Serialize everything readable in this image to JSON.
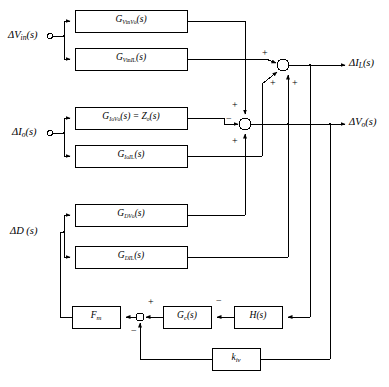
{
  "diagram": {
    "inputs": [
      {
        "id": "dvin",
        "label_html": "ΔV<sub class=\"sub\">in</sub>(s)",
        "terminal": "open-circle"
      },
      {
        "id": "dio",
        "label_html": "ΔI<sub class=\"sub\">o</sub>(s)",
        "terminal": "open-circle"
      },
      {
        "id": "dd",
        "label_html": "ΔD (s)",
        "terminal": "none"
      }
    ],
    "outputs": [
      {
        "id": "dil",
        "label_html": "ΔI<sub class=\"sub\">L</sub>(s)"
      },
      {
        "id": "dvo",
        "label_html": "ΔV<sub class=\"sub\">o</sub>(s)"
      }
    ],
    "blocks": [
      {
        "id": "g_vin_vo",
        "label_html": "G<sub class=\"sub2\">V<span class=\"up\">in</span>V<span class=\"up\">o</span></sub>(s)",
        "x": 75,
        "y": 10,
        "w": 112,
        "h": 22
      },
      {
        "id": "g_vin_il",
        "label_html": "G<sub class=\"sub2\">V<span class=\"up\">in</span>I<span class=\"up\">L</span></sub>(s)",
        "x": 75,
        "y": 48,
        "w": 112,
        "h": 22
      },
      {
        "id": "g_io_vo",
        "label_html": "G<sub class=\"sub2\">I<span class=\"up\">o</span>V<span class=\"up\">o</span></sub>(s) = Z<sub class=\"sub2\">o</sub>(s)",
        "x": 75,
        "y": 107,
        "w": 112,
        "h": 22
      },
      {
        "id": "g_io_il",
        "label_html": "G<sub class=\"sub2\">I<span class=\"up\">o</span>I<span class=\"up\">L</span></sub>(s)",
        "x": 75,
        "y": 145,
        "w": 112,
        "h": 22
      },
      {
        "id": "g_d_vo",
        "label_html": "G<sub class=\"sub2\">DV<span class=\"up\">o</span></sub>(s)",
        "x": 75,
        "y": 204,
        "w": 112,
        "h": 22
      },
      {
        "id": "g_d_il",
        "label_html": "G<sub class=\"sub2\">DI<span class=\"up\">L</span></sub>(s)",
        "x": 75,
        "y": 246,
        "w": 112,
        "h": 22
      },
      {
        "id": "fm",
        "label_html": "F<sub class=\"sub\">m</sub>",
        "x": 72,
        "y": 306,
        "w": 48,
        "h": 22
      },
      {
        "id": "gc",
        "label_html": "G<sub class=\"sub\">c</sub>(s)",
        "x": 163,
        "y": 306,
        "w": 48,
        "h": 22
      },
      {
        "id": "h",
        "label_html": "H(s)",
        "x": 234,
        "y": 306,
        "w": 48,
        "h": 22
      },
      {
        "id": "kiv",
        "label_html": "k<sub class=\"sub\">iv</sub>",
        "x": 212,
        "y": 348,
        "w": 48,
        "h": 22
      }
    ],
    "summing_junctions": [
      {
        "id": "sum-il",
        "cx": 283,
        "cy": 65,
        "r": 6,
        "signs": [
          "+",
          "+",
          "+"
        ]
      },
      {
        "id": "sum-vo",
        "cx": 245,
        "cy": 124,
        "r": 6,
        "signs": [
          "−",
          "+",
          "+"
        ]
      },
      {
        "id": "sum-ctrl",
        "cx": 140,
        "cy": 317,
        "r": 4,
        "signs": [
          "+",
          "−"
        ]
      }
    ],
    "sign_markers": [
      {
        "id": "plus-il-left",
        "text": "+",
        "x": 262,
        "y": 48
      },
      {
        "id": "plus-il-diag",
        "text": "+",
        "x": 270,
        "y": 78
      },
      {
        "id": "plus-il-bottom",
        "text": "+",
        "x": 292,
        "y": 78
      },
      {
        "id": "plus-vo-top",
        "text": "+",
        "x": 232,
        "y": 100
      },
      {
        "id": "minus-vo-left",
        "text": "−",
        "x": 226,
        "y": 116
      },
      {
        "id": "plus-vo-bottom",
        "text": "+",
        "x": 232,
        "y": 138
      },
      {
        "id": "plus-ctrl",
        "text": "+",
        "x": 148,
        "y": 299
      },
      {
        "id": "minus-ctrl",
        "text": "−",
        "x": 132,
        "y": 328
      },
      {
        "id": "minus-gc",
        "text": "−",
        "x": 216,
        "y": 298
      }
    ]
  }
}
